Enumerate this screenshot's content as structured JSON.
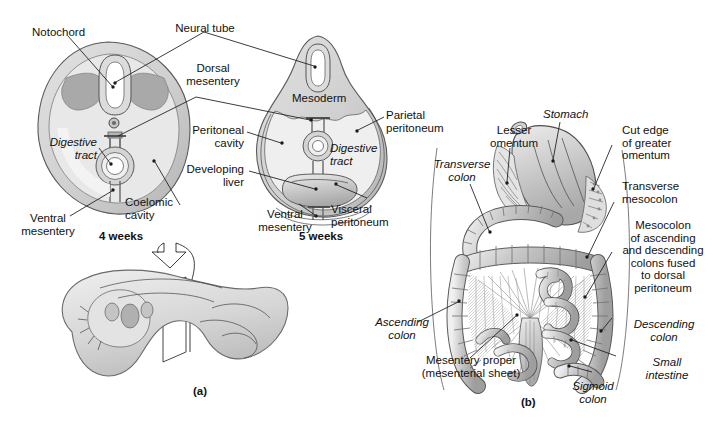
{
  "figure": {
    "background_color": "#ffffff",
    "ink_color": "#1a1a1a"
  },
  "panel_a": {
    "caption": "(a)",
    "sections": [
      {
        "id": "four-weeks",
        "stage_label": "4 weeks"
      },
      {
        "id": "five-weeks",
        "stage_label": "5 weeks"
      }
    ],
    "labels": [
      {
        "id": "notochord",
        "text": "Notochord",
        "style": "roman"
      },
      {
        "id": "neural-tube",
        "text": "Neural tube",
        "style": "roman"
      },
      {
        "id": "dorsal-mesentery",
        "text": "Dorsal\nmesentery",
        "style": "roman"
      },
      {
        "id": "mesoderm",
        "text": "Mesoderm",
        "style": "roman"
      },
      {
        "id": "parietal-peritoneum",
        "text": "Parietal\nperitoneum",
        "style": "roman"
      },
      {
        "id": "peritoneal-cavity",
        "text": "Peritoneal\ncavity",
        "style": "roman"
      },
      {
        "id": "developing-liver",
        "text": "Developing\nliver",
        "style": "roman"
      },
      {
        "id": "digestive-tract-4",
        "text": "Digestive\ntract",
        "style": "italic"
      },
      {
        "id": "digestive-tract-5",
        "text": "Digestive\ntract",
        "style": "italic"
      },
      {
        "id": "coelomic-cavity",
        "text": "Coelomic\ncavity",
        "style": "roman"
      },
      {
        "id": "ventral-mesentery-4",
        "text": "Ventral\nmesentery",
        "style": "roman"
      },
      {
        "id": "ventral-mesentery-5",
        "text": "Ventral\nmesentery",
        "style": "roman"
      },
      {
        "id": "visceral-peritoneum",
        "text": "Visceral\nperitoneum",
        "style": "roman"
      }
    ]
  },
  "panel_b": {
    "caption": "(b)",
    "labels": [
      {
        "id": "stomach",
        "text": "Stomach",
        "style": "italic"
      },
      {
        "id": "lesser-omentum",
        "text": "Lesser\nomentum",
        "style": "roman"
      },
      {
        "id": "transverse-colon",
        "text": "Transverse\ncolon",
        "style": "italic"
      },
      {
        "id": "cut-edge-omentum",
        "text": "Cut edge\nof greater\nomentum",
        "style": "roman"
      },
      {
        "id": "transverse-mesocolon",
        "text": "Transverse\nmesocolon",
        "style": "roman"
      },
      {
        "id": "mesocolon-fused",
        "text": "Mesocolon\nof ascending\nand descending\ncolons fused\nto dorsal\nperitoneum",
        "style": "roman"
      },
      {
        "id": "descending-colon",
        "text": "Descending\ncolon",
        "style": "italic"
      },
      {
        "id": "small-intestine",
        "text": "Small\nintestine",
        "style": "italic"
      },
      {
        "id": "sigmoid-colon",
        "text": "Sigmoid\ncolon",
        "style": "italic"
      },
      {
        "id": "ascending-colon",
        "text": "Ascending\ncolon",
        "style": "italic"
      },
      {
        "id": "mesentery-proper",
        "text": "Mesentery proper\n(mesenterial sheet)",
        "style": "roman"
      }
    ]
  },
  "palette": {
    "tissue_light": "#d9d9d9",
    "tissue_mid": "#bfbfbf",
    "tissue_dark": "#a6a6a6",
    "tissue_darker": "#8c8c8c",
    "outline": "#4a4a4a",
    "white": "#ffffff"
  }
}
